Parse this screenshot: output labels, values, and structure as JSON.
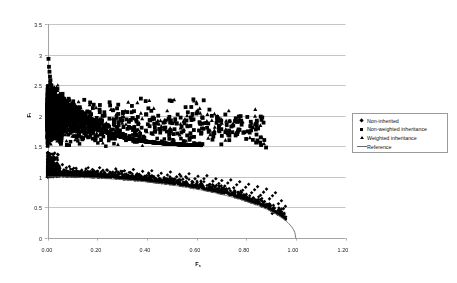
{
  "figure": {
    "background": "#ffffff",
    "plot_frame_color": "#9a9a9a",
    "gridline_color": "#b6b6b6"
  },
  "axes": {
    "x_title": "F",
    "x_title_sub": "s",
    "y_title": "F",
    "y_title_sub": "i",
    "x_ticks": [
      "0.00",
      "0.20",
      "0.40",
      "0.60",
      "0.80",
      "1.00",
      "1.20"
    ],
    "y_ticks": [
      "0",
      "0.5",
      "1",
      "1.5",
      "2",
      "2.5",
      "3",
      "3.5"
    ]
  },
  "legend": {
    "items": [
      {
        "label": "Non-inherited",
        "marker": "diamond",
        "color": "#000000"
      },
      {
        "label": "Non-weighted inheritance",
        "marker": "square",
        "color": "#000000"
      },
      {
        "label": "Weighted inheritance",
        "marker": "triangle",
        "color": "#000000"
      },
      {
        "label": "Reference",
        "marker": "line",
        "color": "#6b6b6b"
      }
    ]
  },
  "chart_data": {
    "type": "scatter",
    "title": "",
    "xlabel": "Fs",
    "ylabel": "Fi",
    "xlim": [
      0.0,
      1.2
    ],
    "ylim": [
      0.0,
      3.5
    ],
    "xticks": [
      0.0,
      0.2,
      0.4,
      0.6,
      0.8,
      1.0,
      1.2
    ],
    "yticks": [
      0.0,
      0.5,
      1.0,
      1.5,
      2.0,
      2.5,
      3.0,
      3.5
    ],
    "grid": "horizontal",
    "legend_position": "right",
    "series": [
      {
        "name": "Non-inherited",
        "marker": "diamond",
        "color": "#000000",
        "description": "Lower band of points lying just above the reference curve, running from (0.00, 1.30) down to (0.95, 0.35).",
        "points": [
          [
            0.003,
            1.22
          ],
          [
            0.006,
            1.18
          ],
          [
            0.008,
            1.31
          ],
          [
            0.01,
            1.12
          ],
          [
            0.012,
            1.25
          ],
          [
            0.015,
            1.08
          ],
          [
            0.018,
            1.19
          ],
          [
            0.02,
            1.27
          ],
          [
            0.022,
            1.1
          ],
          [
            0.025,
            1.16
          ],
          [
            0.028,
            1.06
          ],
          [
            0.03,
            1.21
          ],
          [
            0.034,
            1.13
          ],
          [
            0.038,
            1.05
          ],
          [
            0.041,
            1.18
          ],
          [
            0.045,
            1.09
          ],
          [
            0.05,
            1.14
          ],
          [
            0.055,
            1.07
          ],
          [
            0.06,
            1.2
          ],
          [
            0.065,
            1.11
          ],
          [
            0.07,
            1.04
          ],
          [
            0.076,
            1.15
          ],
          [
            0.082,
            1.08
          ],
          [
            0.088,
            1.17
          ],
          [
            0.094,
            1.06
          ],
          [
            0.1,
            1.12
          ],
          [
            0.108,
            1.05
          ],
          [
            0.115,
            1.14
          ],
          [
            0.122,
            1.09
          ],
          [
            0.13,
            1.03
          ],
          [
            0.138,
            1.11
          ],
          [
            0.146,
            1.06
          ],
          [
            0.155,
            1.13
          ],
          [
            0.164,
            1.02
          ],
          [
            0.172,
            1.08
          ],
          [
            0.181,
            1.12
          ],
          [
            0.19,
            1.04
          ],
          [
            0.2,
            1.09
          ],
          [
            0.21,
            1.15
          ],
          [
            0.22,
            1.02
          ],
          [
            0.23,
            1.07
          ],
          [
            0.241,
            1.11
          ],
          [
            0.252,
            1.03
          ],
          [
            0.263,
            1.08
          ],
          [
            0.275,
            1.13
          ],
          [
            0.286,
            1.0
          ],
          [
            0.298,
            1.06
          ],
          [
            0.31,
            1.1
          ],
          [
            0.322,
            1.02
          ],
          [
            0.334,
            1.07
          ],
          [
            0.346,
            1.12
          ],
          [
            0.358,
            0.99
          ],
          [
            0.37,
            1.04
          ],
          [
            0.383,
            1.09
          ],
          [
            0.396,
            1.01
          ],
          [
            0.408,
            1.05
          ],
          [
            0.42,
            1.1
          ],
          [
            0.433,
            0.97
          ],
          [
            0.446,
            1.02
          ],
          [
            0.458,
            1.06
          ],
          [
            0.47,
            0.99
          ],
          [
            0.483,
            1.03
          ],
          [
            0.495,
            1.08
          ],
          [
            0.508,
            0.95
          ],
          [
            0.52,
            1.0
          ],
          [
            0.532,
            1.04
          ],
          [
            0.545,
            0.96
          ],
          [
            0.557,
            1.0
          ],
          [
            0.57,
            1.05
          ],
          [
            0.582,
            0.92
          ],
          [
            0.594,
            0.97
          ],
          [
            0.606,
            1.01
          ],
          [
            0.618,
            0.93
          ],
          [
            0.63,
            0.97
          ],
          [
            0.642,
            1.02
          ],
          [
            0.654,
            0.88
          ],
          [
            0.666,
            0.93
          ],
          [
            0.678,
            0.97
          ],
          [
            0.69,
            0.89
          ],
          [
            0.702,
            0.94
          ],
          [
            0.714,
            0.85
          ],
          [
            0.726,
            0.9
          ],
          [
            0.738,
            0.95
          ],
          [
            0.75,
            0.82
          ],
          [
            0.762,
            0.87
          ],
          [
            0.774,
            0.92
          ],
          [
            0.786,
            0.78
          ],
          [
            0.798,
            0.83
          ],
          [
            0.81,
            0.88
          ],
          [
            0.822,
            0.74
          ],
          [
            0.834,
            0.79
          ],
          [
            0.846,
            0.84
          ],
          [
            0.858,
            0.7
          ],
          [
            0.87,
            0.75
          ],
          [
            0.882,
            0.8
          ],
          [
            0.894,
            0.64
          ],
          [
            0.906,
            0.69
          ],
          [
            0.918,
            0.74
          ],
          [
            0.93,
            0.56
          ],
          [
            0.942,
            0.61
          ],
          [
            0.95,
            0.48
          ],
          [
            0.958,
            0.52
          ],
          [
            0.93,
            0.44
          ],
          [
            0.905,
            0.4
          ],
          [
            0.88,
            0.52
          ]
        ]
      },
      {
        "name": "Non-weighted inheritance",
        "marker": "square",
        "color": "#000000",
        "description": "Dense cloud between Fi = 1.5 and 2.9, extremely concentrated near Fs = 0, thinning toward Fs = 0.8; isolated points near (0.02, 2.95) and (0.50, 2.25).",
        "points": [
          [
            0.004,
            2.93
          ],
          [
            0.006,
            2.8
          ],
          [
            0.008,
            2.72
          ],
          [
            0.01,
            2.64
          ],
          [
            0.012,
            2.58
          ],
          [
            0.014,
            2.5
          ],
          [
            0.016,
            2.44
          ],
          [
            0.018,
            2.38
          ],
          [
            0.02,
            2.34
          ],
          [
            0.022,
            2.28
          ],
          [
            0.024,
            2.22
          ],
          [
            0.026,
            2.18
          ],
          [
            0.028,
            2.12
          ],
          [
            0.03,
            2.08
          ],
          [
            0.032,
            2.02
          ],
          [
            0.034,
            1.98
          ],
          [
            0.036,
            1.94
          ],
          [
            0.038,
            1.88
          ],
          [
            0.04,
            1.84
          ],
          [
            0.042,
            1.78
          ],
          [
            0.044,
            1.74
          ],
          [
            0.046,
            1.7
          ],
          [
            0.048,
            1.66
          ],
          [
            0.05,
            1.62
          ],
          [
            0.052,
            1.58
          ],
          [
            0.054,
            1.54
          ],
          [
            0.056,
            1.6
          ],
          [
            0.058,
            1.68
          ],
          [
            0.06,
            1.76
          ],
          [
            0.062,
            1.84
          ],
          [
            0.064,
            1.92
          ],
          [
            0.066,
            2.0
          ],
          [
            0.068,
            2.08
          ],
          [
            0.07,
            2.16
          ],
          [
            0.072,
            2.24
          ],
          [
            0.076,
            1.95
          ],
          [
            0.08,
            2.05
          ],
          [
            0.084,
            1.85
          ],
          [
            0.088,
            2.12
          ],
          [
            0.092,
            1.72
          ],
          [
            0.096,
            1.98
          ],
          [
            0.1,
            2.2
          ],
          [
            0.106,
            1.8
          ],
          [
            0.112,
            2.02
          ],
          [
            0.118,
            1.65
          ],
          [
            0.124,
            1.9
          ],
          [
            0.13,
            2.14
          ],
          [
            0.136,
            1.74
          ],
          [
            0.142,
            1.96
          ],
          [
            0.148,
            2.26
          ],
          [
            0.155,
            1.68
          ],
          [
            0.162,
            1.88
          ],
          [
            0.17,
            2.06
          ],
          [
            0.178,
            1.78
          ],
          [
            0.186,
            2.18
          ],
          [
            0.194,
            1.62
          ],
          [
            0.202,
            1.92
          ],
          [
            0.21,
            2.1
          ],
          [
            0.22,
            1.7
          ],
          [
            0.23,
            2.0
          ],
          [
            0.24,
            1.82
          ],
          [
            0.25,
            2.22
          ],
          [
            0.26,
            1.66
          ],
          [
            0.27,
            1.94
          ],
          [
            0.28,
            2.12
          ],
          [
            0.292,
            1.76
          ],
          [
            0.304,
            2.04
          ],
          [
            0.316,
            1.6
          ],
          [
            0.328,
            1.9
          ],
          [
            0.34,
            2.16
          ],
          [
            0.352,
            1.72
          ],
          [
            0.364,
            1.98
          ],
          [
            0.376,
            2.28
          ],
          [
            0.39,
            1.64
          ],
          [
            0.404,
            1.86
          ],
          [
            0.418,
            2.08
          ],
          [
            0.432,
            1.74
          ],
          [
            0.446,
            2.0
          ],
          [
            0.46,
            1.58
          ],
          [
            0.476,
            1.92
          ],
          [
            0.492,
            2.25
          ],
          [
            0.5,
            2.24
          ],
          [
            0.508,
            1.7
          ],
          [
            0.524,
            2.02
          ],
          [
            0.54,
            1.82
          ],
          [
            0.556,
            2.14
          ],
          [
            0.572,
            1.62
          ],
          [
            0.588,
            1.94
          ],
          [
            0.604,
            2.06
          ],
          [
            0.62,
            1.72
          ],
          [
            0.636,
            1.88
          ],
          [
            0.652,
            2.1
          ],
          [
            0.668,
            1.66
          ],
          [
            0.684,
            1.96
          ],
          [
            0.7,
            1.78
          ],
          [
            0.716,
            2.02
          ],
          [
            0.732,
            1.6
          ],
          [
            0.748,
            1.84
          ],
          [
            0.764,
            1.7
          ],
          [
            0.78,
            1.92
          ],
          [
            0.8,
            1.62
          ],
          [
            0.82,
            1.76
          ],
          [
            0.84,
            1.56
          ],
          [
            0.86,
            1.52
          ],
          [
            0.88,
            1.48
          ]
        ]
      },
      {
        "name": "Weighted inheritance",
        "marker": "triangle",
        "color": "#000000",
        "description": "Triangles interleaved with the square cloud, mostly Fi between 1.6 and 2.3, sparser at larger Fs.",
        "points": [
          [
            0.015,
            2.3
          ],
          [
            0.025,
            2.12
          ],
          [
            0.035,
            1.96
          ],
          [
            0.045,
            1.8
          ],
          [
            0.055,
            2.2
          ],
          [
            0.07,
            2.04
          ],
          [
            0.085,
            1.88
          ],
          [
            0.1,
            2.14
          ],
          [
            0.118,
            1.74
          ],
          [
            0.135,
            2.02
          ],
          [
            0.152,
            1.9
          ],
          [
            0.17,
            2.18
          ],
          [
            0.19,
            1.78
          ],
          [
            0.21,
            2.06
          ],
          [
            0.232,
            1.86
          ],
          [
            0.255,
            2.1
          ],
          [
            0.278,
            1.7
          ],
          [
            0.3,
            1.98
          ],
          [
            0.325,
            2.22
          ],
          [
            0.35,
            1.82
          ],
          [
            0.376,
            2.04
          ],
          [
            0.4,
            1.74
          ],
          [
            0.428,
            2.12
          ],
          [
            0.455,
            1.92
          ],
          [
            0.482,
            2.08
          ],
          [
            0.51,
            2.26
          ],
          [
            0.536,
            1.8
          ],
          [
            0.562,
            2.0
          ],
          [
            0.59,
            2.24
          ],
          [
            0.6,
            2.22
          ],
          [
            0.616,
            1.86
          ],
          [
            0.644,
            2.02
          ],
          [
            0.672,
            1.76
          ],
          [
            0.7,
            1.94
          ],
          [
            0.73,
            2.08
          ],
          [
            0.758,
            1.72
          ],
          [
            0.786,
            1.9
          ],
          [
            0.815,
            1.64
          ],
          [
            0.845,
            1.58
          ],
          [
            0.872,
            1.54
          ]
        ]
      }
    ],
    "reference_curve": {
      "name": "Reference",
      "color": "#6b6b6b",
      "description": "Smooth descending curve from (0.00, 1.00) to approximately (1.00, 0.00); quarter-ellipse shaped.",
      "equation": "Fi = sqrt(1 - Fs^2)",
      "points": [
        [
          0.0,
          1.0
        ],
        [
          0.05,
          1.0
        ],
        [
          0.1,
          0.99
        ],
        [
          0.15,
          0.99
        ],
        [
          0.2,
          0.98
        ],
        [
          0.25,
          0.97
        ],
        [
          0.3,
          0.95
        ],
        [
          0.35,
          0.94
        ],
        [
          0.4,
          0.92
        ],
        [
          0.45,
          0.89
        ],
        [
          0.5,
          0.87
        ],
        [
          0.55,
          0.84
        ],
        [
          0.6,
          0.8
        ],
        [
          0.65,
          0.76
        ],
        [
          0.7,
          0.71
        ],
        [
          0.75,
          0.66
        ],
        [
          0.8,
          0.6
        ],
        [
          0.85,
          0.53
        ],
        [
          0.9,
          0.44
        ],
        [
          0.95,
          0.31
        ],
        [
          0.98,
          0.2
        ],
        [
          1.0,
          0.0
        ]
      ]
    }
  }
}
